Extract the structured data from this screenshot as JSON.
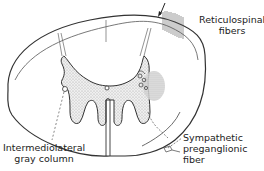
{
  "figure": {
    "labels": {
      "reticulospinal": {
        "line1": "Reticulospinal",
        "line2": "fibers"
      },
      "intermediolateral": {
        "line1": "Intermediolateral",
        "line2": "gray column"
      },
      "sympathetic": {
        "line1": "Sympathetic",
        "line2": "preganglionic",
        "line3": "fiber"
      }
    },
    "colors": {
      "line": "#333333",
      "gray_matter_fill": "#d9d9d9",
      "text": "#222222",
      "background": "#ffffff"
    },
    "icons": {
      "arrow": "down-left-arrow"
    }
  }
}
